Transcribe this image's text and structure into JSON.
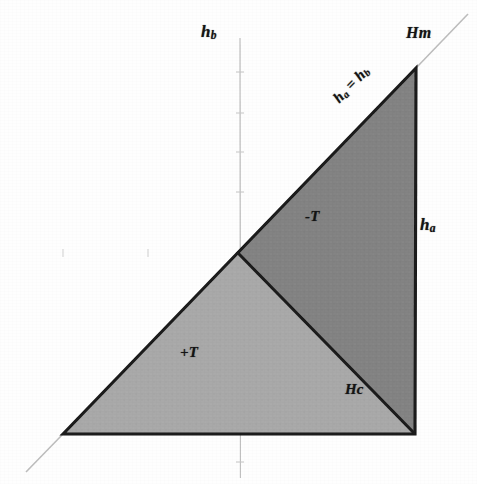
{
  "figure": {
    "type": "geometric-region-diagram",
    "background_color": "#fefefe"
  },
  "axes": {
    "vertical": {
      "label": "hb",
      "label_base": "h",
      "label_sub": "b",
      "x_px": 240,
      "color": "#b9b9b9"
    },
    "horizontal": {
      "label": "ha",
      "label_base": "h",
      "label_sub": "a",
      "y_px": 252,
      "color": "#b9b9b9"
    },
    "origin": {
      "x_px": 237,
      "y_px": 252
    }
  },
  "labels": {
    "vertical_axis": "hb",
    "horizontal_axis": "ha",
    "upper_right": "Hm",
    "diagonal": "ha = hb",
    "dark_region": "-T",
    "light_region": "+T",
    "inner_diagonal": "Hc"
  },
  "regions": [
    {
      "name": "negative-torsion-region",
      "label": "-T",
      "fill": "#838383",
      "polygon": "237,252 416,68 415,434"
    },
    {
      "name": "positive-torsion-region",
      "label": "+T",
      "fill": "#a9a9a9",
      "polygon": "63,434 237,252 415,434"
    }
  ],
  "lines": [
    {
      "name": "hypotenuse-ha-equals-hb",
      "label": "ha = hb",
      "from": "63,434",
      "to": "416,68",
      "style": "solid",
      "color": "#161616"
    },
    {
      "name": "inner-diagonal-hc",
      "label": "Hc",
      "from": "237,252",
      "to": "415,434",
      "style": "solid",
      "color": "#161616"
    },
    {
      "name": "right-edge-hm",
      "label": "Hm",
      "from": "416,68",
      "to": "415,434",
      "style": "solid",
      "color": "#161616"
    },
    {
      "name": "bottom-edge",
      "from": "63,434",
      "to": "415,434",
      "style": "solid",
      "color": "#161616"
    },
    {
      "name": "diagonal-extension-upper",
      "from": "416,68",
      "to": "466,16",
      "style": "faint",
      "color": "#bdbdbd"
    },
    {
      "name": "diagonal-extension-lower",
      "from": "63,434",
      "to": "28,470",
      "style": "faint",
      "color": "#bdbdbd"
    }
  ],
  "chart_data": {
    "type": "scatter",
    "title": "",
    "xlabel": "ha",
    "ylabel": "hb",
    "grid": false,
    "legend": "none",
    "annotations": [
      "hb",
      "Hm",
      "ha = hb",
      "ha",
      "-T",
      "+T",
      "Hc"
    ],
    "series": [
      {
        "name": "-T region (dark gray)",
        "vertices_px": [
          [
            237,
            252
          ],
          [
            416,
            68
          ],
          [
            415,
            434
          ]
        ],
        "fill": "#838383"
      },
      {
        "name": "+T region (light gray)",
        "vertices_px": [
          [
            63,
            434
          ],
          [
            237,
            252
          ],
          [
            415,
            434
          ]
        ],
        "fill": "#a9a9a9"
      }
    ]
  }
}
